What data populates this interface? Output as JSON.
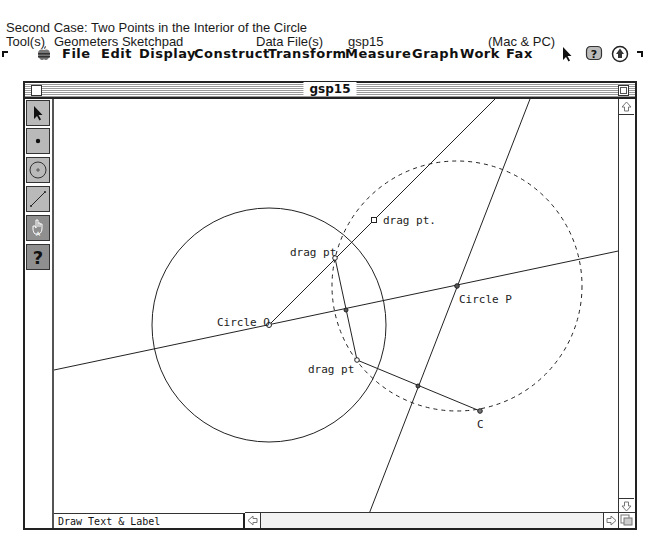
{
  "caption": {
    "line1": "Second Case:  Two Points in the Interior of the Circle",
    "tools_label": "Tool(s)",
    "tools_value": "Geometers Sketchpad",
    "data_file_label": "Data File(s)",
    "data_file_value": "gsp15",
    "platform": "(Mac & PC)"
  },
  "menubar": {
    "items": [
      "File",
      "Edit",
      "Display",
      "Construct",
      "Transform",
      "Measure",
      "Graph",
      "Work",
      "Fax"
    ],
    "icons": [
      "apple-icon",
      "arrow-cursor-icon",
      "help-balloon-icon",
      "application-icon"
    ]
  },
  "window": {
    "title": "gsp15",
    "status_text": "Draw Text & Label"
  },
  "palette": {
    "tools": [
      {
        "name": "selection-arrow-tool",
        "icon": "arrow-icon"
      },
      {
        "name": "point-tool",
        "icon": "point-icon"
      },
      {
        "name": "circle-tool",
        "icon": "circle-icon"
      },
      {
        "name": "segment-tool",
        "icon": "segment-icon"
      },
      {
        "name": "text-tool",
        "icon": "hand-text-icon"
      },
      {
        "name": "help-tool",
        "icon": "question-icon",
        "label": "?"
      }
    ]
  },
  "sketch": {
    "labels": {
      "circle_o": "Circle O",
      "circle_p": "Circle P",
      "drag_pt_1": "drag pt",
      "drag_pt_2": "drag pt.",
      "drag_pt_3": "drag pt",
      "point_c": "C"
    }
  }
}
